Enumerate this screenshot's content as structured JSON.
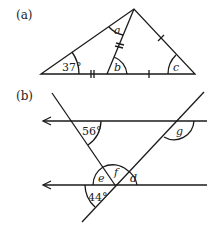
{
  "figure_a": {
    "part_label": "(a)",
    "angles": {
      "given": "37°",
      "a": "a",
      "b": "b",
      "c": "c"
    }
  },
  "figure_b": {
    "part_label": "(b)",
    "angles": {
      "top": "56°",
      "g": "g",
      "e": "e",
      "f": "f",
      "d": "d",
      "bottom": "44°"
    }
  },
  "colors": {
    "stroke": "#1a1a1a",
    "background": "#ffffff"
  }
}
